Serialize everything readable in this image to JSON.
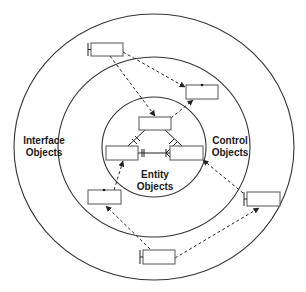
{
  "figure": {
    "cropped_caption": "",
    "layers": [
      {
        "id": "interface",
        "label_line1": "Interface",
        "label_line2": "Objects"
      },
      {
        "id": "control",
        "label_line1": "Control",
        "label_line2": "Objects"
      },
      {
        "id": "entity",
        "label_line1": "Entity",
        "label_line2": "Objects"
      }
    ],
    "colors": {
      "stroke": "#333333",
      "background": "#ffffff"
    }
  }
}
